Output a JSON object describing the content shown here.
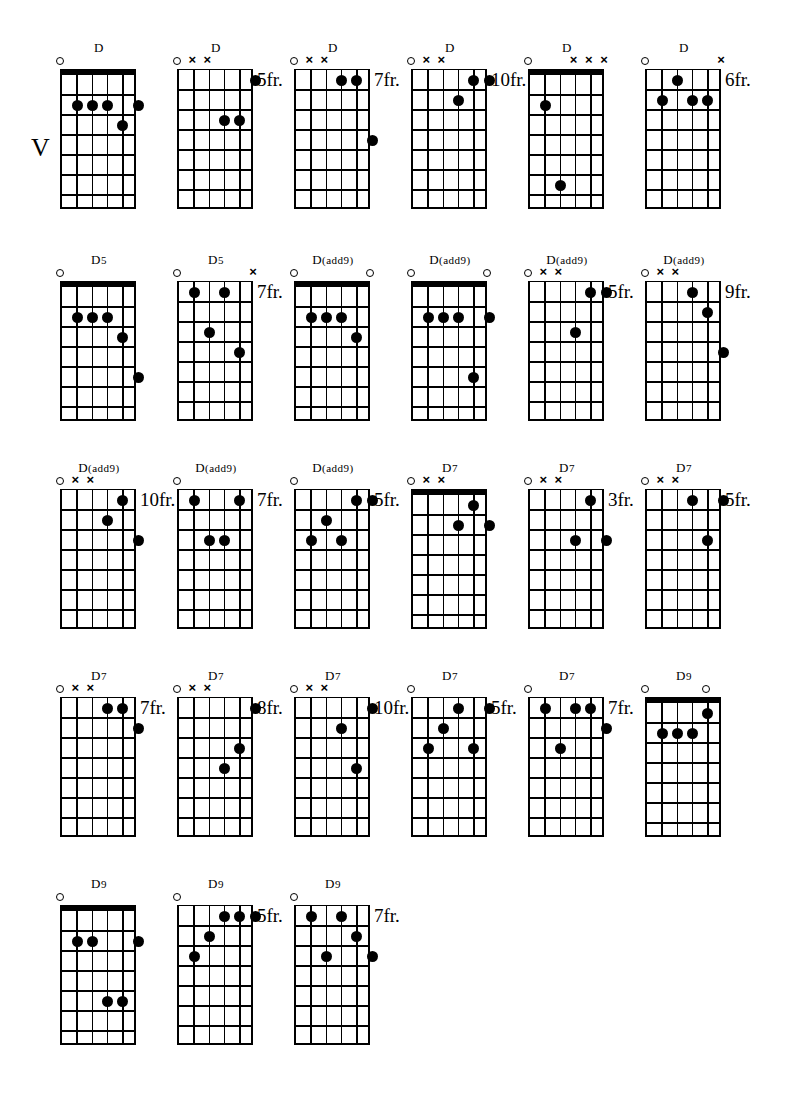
{
  "page": {
    "section_marker": "V",
    "section_marker_x": 31,
    "section_marker_y": 133,
    "strings": 6,
    "frets": 7,
    "open_symbol": "o",
    "muted_symbol": "x",
    "fret_suffix": "fr."
  },
  "rows": [
    {
      "top": 40
    },
    {
      "top": 252
    },
    {
      "top": 460
    },
    {
      "top": 668
    },
    {
      "top": 876
    }
  ],
  "columns": [
    60,
    177,
    294,
    411,
    528,
    645
  ],
  "chords": [
    {
      "id": "c1",
      "row": 0,
      "col": 0,
      "name": "D",
      "suffix": "",
      "fret_label": "",
      "nut": true,
      "markers": [
        {
          "string": 1,
          "type": "o"
        }
      ],
      "dots": [
        {
          "string": 2,
          "fret": 2
        },
        {
          "string": 3,
          "fret": 2
        },
        {
          "string": 4,
          "fret": 2
        },
        {
          "string": 6,
          "fret": 2
        },
        {
          "string": 5,
          "fret": 3
        }
      ]
    },
    {
      "id": "c2",
      "row": 0,
      "col": 1,
      "name": "D",
      "suffix": "",
      "fret_label": "5fr.",
      "nut": false,
      "markers": [
        {
          "string": 1,
          "type": "o"
        },
        {
          "string": 2,
          "type": "x"
        },
        {
          "string": 3,
          "type": "x"
        }
      ],
      "dots": [
        {
          "string": 6,
          "fret": 1
        },
        {
          "string": 4,
          "fret": 3
        },
        {
          "string": 5,
          "fret": 3
        }
      ]
    },
    {
      "id": "c3",
      "row": 0,
      "col": 2,
      "name": "D",
      "suffix": "",
      "fret_label": "7fr.",
      "nut": false,
      "markers": [
        {
          "string": 1,
          "type": "o"
        },
        {
          "string": 2,
          "type": "x"
        },
        {
          "string": 3,
          "type": "x"
        }
      ],
      "dots": [
        {
          "string": 4,
          "fret": 1
        },
        {
          "string": 5,
          "fret": 1
        },
        {
          "string": 6,
          "fret": 4
        }
      ]
    },
    {
      "id": "c4",
      "row": 0,
      "col": 3,
      "name": "D",
      "suffix": "",
      "fret_label": "10fr.",
      "nut": false,
      "markers": [
        {
          "string": 1,
          "type": "o"
        },
        {
          "string": 2,
          "type": "x"
        },
        {
          "string": 3,
          "type": "x"
        }
      ],
      "dots": [
        {
          "string": 5,
          "fret": 1
        },
        {
          "string": 6,
          "fret": 1
        },
        {
          "string": 4,
          "fret": 2
        }
      ]
    },
    {
      "id": "c5",
      "row": 0,
      "col": 4,
      "name": "D",
      "suffix": "",
      "fret_label": "",
      "nut": true,
      "markers": [
        {
          "string": 1,
          "type": "o"
        },
        {
          "string": 4,
          "type": "x"
        },
        {
          "string": 5,
          "type": "x"
        },
        {
          "string": 6,
          "type": "x"
        }
      ],
      "dots": [
        {
          "string": 2,
          "fret": 2
        },
        {
          "string": 3,
          "fret": 6
        }
      ]
    },
    {
      "id": "c6",
      "row": 0,
      "col": 5,
      "name": "D",
      "suffix": "",
      "fret_label": "6fr.",
      "nut": false,
      "markers": [
        {
          "string": 1,
          "type": "o"
        },
        {
          "string": 6,
          "type": "x"
        }
      ],
      "dots": [
        {
          "string": 3,
          "fret": 1
        },
        {
          "string": 2,
          "fret": 2
        },
        {
          "string": 4,
          "fret": 2
        },
        {
          "string": 5,
          "fret": 2
        }
      ]
    },
    {
      "id": "c7",
      "row": 1,
      "col": 0,
      "name": "D",
      "suffix": "5",
      "fret_label": "",
      "nut": true,
      "markers": [
        {
          "string": 1,
          "type": "o"
        }
      ],
      "dots": [
        {
          "string": 2,
          "fret": 2
        },
        {
          "string": 3,
          "fret": 2
        },
        {
          "string": 4,
          "fret": 2
        },
        {
          "string": 5,
          "fret": 3
        },
        {
          "string": 6,
          "fret": 5
        }
      ]
    },
    {
      "id": "c8",
      "row": 1,
      "col": 1,
      "name": "D",
      "suffix": "5",
      "fret_label": "7fr.",
      "nut": false,
      "markers": [
        {
          "string": 1,
          "type": "o"
        },
        {
          "string": 6,
          "type": "x"
        }
      ],
      "dots": [
        {
          "string": 2,
          "fret": 1
        },
        {
          "string": 4,
          "fret": 1
        },
        {
          "string": 3,
          "fret": 3
        },
        {
          "string": 5,
          "fret": 4
        }
      ]
    },
    {
      "id": "c9",
      "row": 1,
      "col": 2,
      "name": "D",
      "suffix": "(add9)",
      "fret_label": "",
      "nut": true,
      "markers": [
        {
          "string": 1,
          "type": "o"
        },
        {
          "string": 6,
          "type": "o"
        }
      ],
      "dots": [
        {
          "string": 2,
          "fret": 2
        },
        {
          "string": 3,
          "fret": 2
        },
        {
          "string": 4,
          "fret": 2
        },
        {
          "string": 5,
          "fret": 3
        }
      ]
    },
    {
      "id": "c10",
      "row": 1,
      "col": 3,
      "name": "D",
      "suffix": "(add9)",
      "fret_label": "",
      "nut": true,
      "markers": [
        {
          "string": 1,
          "type": "o"
        },
        {
          "string": 6,
          "type": "o"
        }
      ],
      "dots": [
        {
          "string": 2,
          "fret": 2
        },
        {
          "string": 3,
          "fret": 2
        },
        {
          "string": 4,
          "fret": 2
        },
        {
          "string": 6,
          "fret": 2
        },
        {
          "string": 5,
          "fret": 5
        }
      ]
    },
    {
      "id": "c11",
      "row": 1,
      "col": 4,
      "name": "D",
      "suffix": "(add9)",
      "fret_label": "5fr.",
      "nut": false,
      "markers": [
        {
          "string": 1,
          "type": "o"
        },
        {
          "string": 2,
          "type": "x"
        },
        {
          "string": 3,
          "type": "x"
        }
      ],
      "dots": [
        {
          "string": 5,
          "fret": 1
        },
        {
          "string": 6,
          "fret": 1
        },
        {
          "string": 4,
          "fret": 3
        }
      ]
    },
    {
      "id": "c12",
      "row": 1,
      "col": 5,
      "name": "D",
      "suffix": "(add9)",
      "fret_label": "9fr.",
      "nut": false,
      "markers": [
        {
          "string": 1,
          "type": "o"
        },
        {
          "string": 2,
          "type": "x"
        },
        {
          "string": 3,
          "type": "x"
        }
      ],
      "dots": [
        {
          "string": 4,
          "fret": 1
        },
        {
          "string": 5,
          "fret": 2
        },
        {
          "string": 6,
          "fret": 4
        }
      ]
    },
    {
      "id": "c13",
      "row": 2,
      "col": 0,
      "name": "D",
      "suffix": "(add9)",
      "fret_label": "10fr.",
      "nut": false,
      "markers": [
        {
          "string": 1,
          "type": "o"
        },
        {
          "string": 2,
          "type": "x"
        },
        {
          "string": 3,
          "type": "x"
        }
      ],
      "dots": [
        {
          "string": 5,
          "fret": 1
        },
        {
          "string": 4,
          "fret": 2
        },
        {
          "string": 6,
          "fret": 3
        }
      ]
    },
    {
      "id": "c14",
      "row": 2,
      "col": 1,
      "name": "D",
      "suffix": "(add9)",
      "fret_label": "7fr.",
      "nut": false,
      "markers": [
        {
          "string": 1,
          "type": "o"
        }
      ],
      "dots": [
        {
          "string": 2,
          "fret": 1
        },
        {
          "string": 5,
          "fret": 1
        },
        {
          "string": 3,
          "fret": 3
        },
        {
          "string": 4,
          "fret": 3
        }
      ]
    },
    {
      "id": "c15",
      "row": 2,
      "col": 2,
      "name": "D",
      "suffix": "(add9)",
      "fret_label": "5fr.",
      "nut": false,
      "markers": [
        {
          "string": 1,
          "type": "o"
        }
      ],
      "dots": [
        {
          "string": 5,
          "fret": 1
        },
        {
          "string": 6,
          "fret": 1
        },
        {
          "string": 3,
          "fret": 2
        },
        {
          "string": 2,
          "fret": 3
        },
        {
          "string": 4,
          "fret": 3
        }
      ]
    },
    {
      "id": "c16",
      "row": 2,
      "col": 3,
      "name": "D",
      "suffix": "7",
      "fret_label": "",
      "nut": true,
      "markers": [
        {
          "string": 1,
          "type": "o"
        },
        {
          "string": 2,
          "type": "x"
        },
        {
          "string": 3,
          "type": "x"
        }
      ],
      "dots": [
        {
          "string": 5,
          "fret": 1
        },
        {
          "string": 4,
          "fret": 2
        },
        {
          "string": 6,
          "fret": 2
        }
      ]
    },
    {
      "id": "c17",
      "row": 2,
      "col": 4,
      "name": "D",
      "suffix": "7",
      "fret_label": "3fr.",
      "nut": false,
      "markers": [
        {
          "string": 1,
          "type": "o"
        },
        {
          "string": 2,
          "type": "x"
        },
        {
          "string": 3,
          "type": "x"
        }
      ],
      "dots": [
        {
          "string": 5,
          "fret": 1
        },
        {
          "string": 4,
          "fret": 3
        },
        {
          "string": 6,
          "fret": 3
        }
      ]
    },
    {
      "id": "c18",
      "row": 2,
      "col": 5,
      "name": "D",
      "suffix": "7",
      "fret_label": "5fr.",
      "nut": false,
      "markers": [
        {
          "string": 1,
          "type": "o"
        },
        {
          "string": 2,
          "type": "x"
        },
        {
          "string": 3,
          "type": "x"
        }
      ],
      "dots": [
        {
          "string": 4,
          "fret": 1
        },
        {
          "string": 6,
          "fret": 1
        },
        {
          "string": 5,
          "fret": 3
        }
      ]
    },
    {
      "id": "c19",
      "row": 3,
      "col": 0,
      "name": "D",
      "suffix": "7",
      "fret_label": "7fr.",
      "nut": false,
      "markers": [
        {
          "string": 1,
          "type": "o"
        },
        {
          "string": 2,
          "type": "x"
        },
        {
          "string": 3,
          "type": "x"
        }
      ],
      "dots": [
        {
          "string": 4,
          "fret": 1
        },
        {
          "string": 5,
          "fret": 1
        },
        {
          "string": 6,
          "fret": 2
        }
      ]
    },
    {
      "id": "c20",
      "row": 3,
      "col": 1,
      "name": "D",
      "suffix": "7",
      "fret_label": "8fr.",
      "nut": false,
      "markers": [
        {
          "string": 1,
          "type": "o"
        },
        {
          "string": 2,
          "type": "x"
        },
        {
          "string": 3,
          "type": "x"
        }
      ],
      "dots": [
        {
          "string": 6,
          "fret": 1
        },
        {
          "string": 5,
          "fret": 3
        },
        {
          "string": 4,
          "fret": 4
        }
      ]
    },
    {
      "id": "c21",
      "row": 3,
      "col": 2,
      "name": "D",
      "suffix": "7",
      "fret_label": "10fr.",
      "nut": false,
      "markers": [
        {
          "string": 1,
          "type": "o"
        },
        {
          "string": 2,
          "type": "x"
        },
        {
          "string": 3,
          "type": "x"
        }
      ],
      "dots": [
        {
          "string": 6,
          "fret": 1
        },
        {
          "string": 4,
          "fret": 2
        },
        {
          "string": 5,
          "fret": 4
        }
      ]
    },
    {
      "id": "c22",
      "row": 3,
      "col": 3,
      "name": "D",
      "suffix": "7",
      "fret_label": "5fr.",
      "nut": false,
      "markers": [
        {
          "string": 1,
          "type": "o"
        }
      ],
      "dots": [
        {
          "string": 4,
          "fret": 1
        },
        {
          "string": 6,
          "fret": 1
        },
        {
          "string": 3,
          "fret": 2
        },
        {
          "string": 2,
          "fret": 3
        },
        {
          "string": 5,
          "fret": 3
        }
      ]
    },
    {
      "id": "c23",
      "row": 3,
      "col": 4,
      "name": "D",
      "suffix": "7",
      "fret_label": "7fr.",
      "nut": false,
      "markers": [
        {
          "string": 1,
          "type": "o"
        }
      ],
      "dots": [
        {
          "string": 2,
          "fret": 1
        },
        {
          "string": 4,
          "fret": 1
        },
        {
          "string": 5,
          "fret": 1
        },
        {
          "string": 6,
          "fret": 2
        },
        {
          "string": 3,
          "fret": 3
        }
      ]
    },
    {
      "id": "c24",
      "row": 3,
      "col": 5,
      "name": "D",
      "suffix": "9",
      "fret_label": "",
      "nut": true,
      "markers": [
        {
          "string": 1,
          "type": "o"
        },
        {
          "string": 5,
          "type": "o"
        }
      ],
      "dots": [
        {
          "string": 5,
          "fret": 1
        },
        {
          "string": 2,
          "fret": 2
        },
        {
          "string": 3,
          "fret": 2
        },
        {
          "string": 4,
          "fret": 2
        }
      ]
    },
    {
      "id": "c25",
      "row": 4,
      "col": 0,
      "name": "D",
      "suffix": "9",
      "fret_label": "",
      "nut": true,
      "markers": [
        {
          "string": 1,
          "type": "o"
        }
      ],
      "dots": [
        {
          "string": 2,
          "fret": 2
        },
        {
          "string": 3,
          "fret": 2
        },
        {
          "string": 6,
          "fret": 2
        },
        {
          "string": 4,
          "fret": 5
        },
        {
          "string": 5,
          "fret": 5
        }
      ]
    },
    {
      "id": "c26",
      "row": 4,
      "col": 1,
      "name": "D",
      "suffix": "9",
      "fret_label": "5fr.",
      "nut": false,
      "markers": [
        {
          "string": 1,
          "type": "o"
        }
      ],
      "dots": [
        {
          "string": 4,
          "fret": 1
        },
        {
          "string": 5,
          "fret": 1
        },
        {
          "string": 6,
          "fret": 1
        },
        {
          "string": 3,
          "fret": 2
        },
        {
          "string": 2,
          "fret": 3
        }
      ]
    },
    {
      "id": "c27",
      "row": 4,
      "col": 2,
      "name": "D",
      "suffix": "9",
      "fret_label": "7fr.",
      "nut": false,
      "markers": [
        {
          "string": 1,
          "type": "o"
        }
      ],
      "dots": [
        {
          "string": 2,
          "fret": 1
        },
        {
          "string": 4,
          "fret": 1
        },
        {
          "string": 5,
          "fret": 2
        },
        {
          "string": 3,
          "fret": 3
        },
        {
          "string": 6,
          "fret": 3
        }
      ]
    }
  ]
}
